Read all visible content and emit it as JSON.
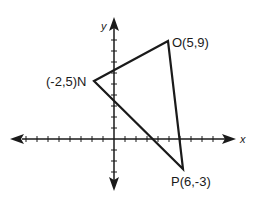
{
  "diagram": {
    "type": "coordinate-plane-triangle",
    "axes": {
      "x_label": "x",
      "y_label": "y",
      "x_ticks_left": 9,
      "x_ticks_right": 10,
      "y_ticks_up": 10,
      "y_ticks_down": 4,
      "unit": 1
    },
    "vertices": [
      {
        "name": "N",
        "x": -2,
        "y": 5,
        "label": "(-2,5)N"
      },
      {
        "name": "O",
        "x": 5,
        "y": 9,
        "label": "O(5,9)"
      },
      {
        "name": "P",
        "x": 6,
        "y": -3,
        "label": "P(6,-3)"
      }
    ],
    "colors": {
      "stroke": "#1a1a1a",
      "background": "#ffffff"
    }
  }
}
